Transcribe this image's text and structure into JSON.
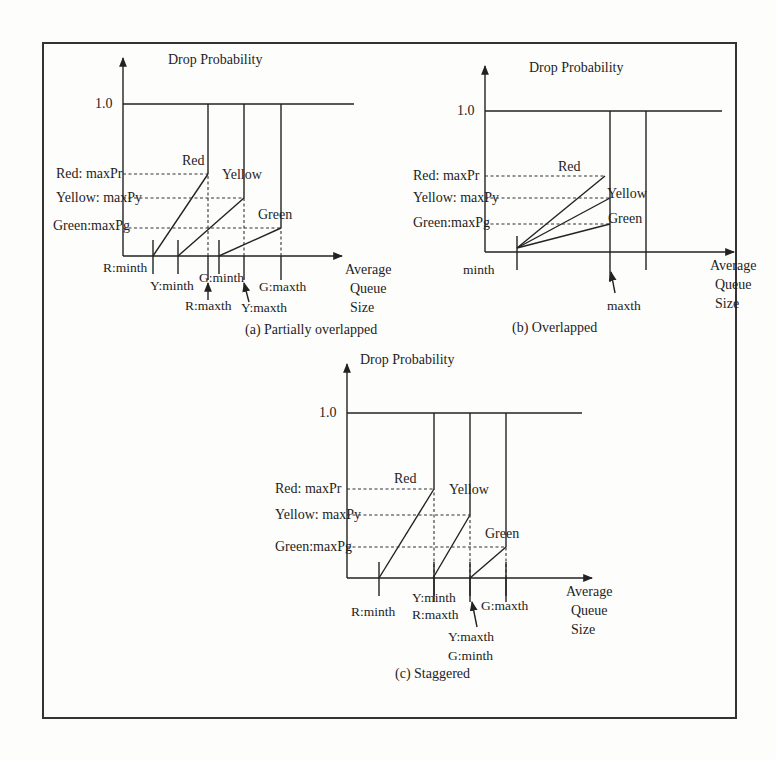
{
  "figure": {
    "frame": {
      "x": 43,
      "y": 43,
      "w": 693,
      "h": 675
    },
    "caption_partial": "Figure: RED drop probability curves for three drop precedences (caption cut off at bottom)",
    "panels": [
      {
        "id": "a",
        "caption": "(a) Partially overlapped",
        "caption_pos": [
          245,
          334
        ],
        "ylabel": "Drop Probability",
        "ylabel_pos": [
          168,
          64
        ],
        "xlabel": [
          "Average",
          "Queue",
          "Size"
        ],
        "xlabel_pos": [
          345,
          274
        ],
        "one_label": "1.0",
        "origin": [
          123,
          256
        ],
        "y_top": 58,
        "x_end": 342,
        "one_y": 104,
        "one_x_end": 354,
        "prob_labels": [
          {
            "text": "Red: maxPr",
            "y": 174,
            "x": 56
          },
          {
            "text": "Yellow: maxPy",
            "y": 198,
            "x": 56
          },
          {
            "text": "Green:maxPg",
            "y": 226,
            "x": 53
          }
        ],
        "curves": [
          {
            "name": "Red",
            "minth": 153,
            "maxth": 208,
            "maxp_y": 174,
            "label_pos": [
              182,
              165
            ]
          },
          {
            "name": "Yellow",
            "minth": 178,
            "maxth": 244,
            "maxp_y": 198,
            "label_pos": [
              222,
              179
            ]
          },
          {
            "name": "Green",
            "minth": 219,
            "maxth": 281,
            "maxp_y": 228,
            "label_pos": [
              258,
              219
            ]
          }
        ],
        "ticks": [
          153,
          178,
          219
        ],
        "tick_labels": [
          {
            "text": "R:minth",
            "x": 103,
            "y": 272
          },
          {
            "text": "Y:minth",
            "x": 150,
            "y": 290
          },
          {
            "text": "G:minth",
            "x": 199,
            "y": 282
          },
          {
            "text": "R:maxth",
            "x": 185,
            "y": 310
          },
          {
            "text": "Y:maxth",
            "x": 241,
            "y": 312
          },
          {
            "text": "G:maxth",
            "x": 259,
            "y": 291
          }
        ],
        "arrows": [
          [
            208,
            300,
            208,
            283
          ],
          [
            249,
            302,
            244,
            283
          ]
        ]
      },
      {
        "id": "b",
        "caption": "(b) Overlapped",
        "caption_pos": [
          512,
          332
        ],
        "ylabel": "Drop Probability",
        "ylabel_pos": [
          529,
          72
        ],
        "xlabel": [
          "Average",
          "Queue",
          "Size"
        ],
        "xlabel_pos": [
          710,
          270
        ],
        "one_label": "1.0",
        "origin": [
          485,
          252
        ],
        "y_top": 66,
        "x_end": 734,
        "one_y": 111,
        "one_x_end": 722,
        "prob_labels": [
          {
            "text": "Red: maxPr",
            "y": 176,
            "x": 413
          },
          {
            "text": "Yellow: maxPy",
            "y": 198,
            "x": 413
          },
          {
            "text": "Green:maxPg",
            "y": 223,
            "x": 413
          }
        ],
        "curves": [
          {
            "name": "Red",
            "minth": 517,
            "maxth": 605,
            "maxp_y": 176,
            "label_pos": [
              558,
              171
            ]
          },
          {
            "name": "Yellow",
            "minth": 517,
            "maxth": 610,
            "maxp_y": 198,
            "label_pos": [
              607,
              198
            ]
          },
          {
            "name": "Green",
            "minth": 517,
            "maxth": 610,
            "maxp_y": 224,
            "label_pos": [
              608,
              223
            ]
          }
        ],
        "ticks": [
          517
        ],
        "tick_labels": [
          {
            "text": "minth",
            "x": 463,
            "y": 274
          },
          {
            "text": "maxth",
            "x": 607,
            "y": 310
          }
        ],
        "arrows": [
          [
            615,
            293,
            611,
            272
          ]
        ],
        "verticals": [
          610,
          646
        ]
      },
      {
        "id": "c",
        "caption": "(c) Staggered",
        "caption_pos": [
          395,
          678
        ],
        "ylabel": "Drop Probability",
        "ylabel_pos": [
          360,
          364
        ],
        "xlabel": [
          "Average",
          "Queue",
          "Size"
        ],
        "xlabel_pos": [
          566,
          596
        ],
        "one_label": "1.0",
        "origin": [
          347,
          578
        ],
        "y_top": 364,
        "x_end": 592,
        "one_y": 413,
        "one_x_end": 582,
        "prob_labels": [
          {
            "text": "Red: maxPr",
            "y": 489,
            "x": 275
          },
          {
            "text": "Yellow: maxPy",
            "y": 515,
            "x": 275
          },
          {
            "text": "Green:maxPg",
            "y": 547,
            "x": 275
          }
        ],
        "curves": [
          {
            "name": "Red",
            "minth": 379,
            "maxth": 434,
            "maxp_y": 489,
            "label_pos": [
              394,
              483
            ]
          },
          {
            "name": "Yellow",
            "minth": 433,
            "maxth": 470,
            "maxp_y": 515,
            "label_pos": [
              449,
              494
            ]
          },
          {
            "name": "Green",
            "minth": 470,
            "maxth": 506,
            "maxp_y": 547,
            "label_pos": [
              485,
              538
            ]
          }
        ],
        "ticks": [
          379,
          434,
          470,
          506
        ],
        "tick_labels": [
          {
            "text": "R:minth",
            "x": 351,
            "y": 616
          },
          {
            "text": "Y:minth",
            "x": 412,
            "y": 602
          },
          {
            "text": "R:maxth",
            "x": 412,
            "y": 619
          },
          {
            "text": "G:maxth",
            "x": 481,
            "y": 610
          },
          {
            "text": "Y:maxth",
            "x": 448,
            "y": 641
          },
          {
            "text": "G:minth",
            "x": 448,
            "y": 660
          }
        ],
        "arrows": [
          [
            477,
            627,
            472,
            602
          ]
        ]
      }
    ]
  }
}
